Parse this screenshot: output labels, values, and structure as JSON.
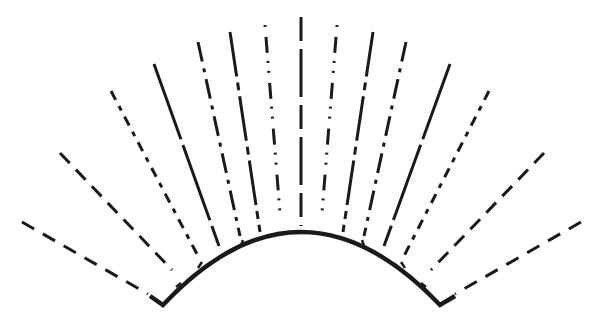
{
  "diagram": {
    "type": "radial-lines-over-arc",
    "stroke_color": "#1a1a1a",
    "background": "#ffffff",
    "arc": {
      "left_end": [
        163,
        305
      ],
      "right_end": [
        440,
        305
      ],
      "apex": [
        301,
        232
      ],
      "left_foot": [
        150,
        296
      ],
      "right_foot": [
        455,
        296
      ]
    },
    "rays": [
      {
        "id": "L1",
        "x1": 22,
        "y1": 222,
        "x2": 148,
        "y2": 294,
        "dash": "14 10"
      },
      {
        "id": "L2",
        "x1": 60,
        "y1": 153,
        "x2": 172,
        "y2": 270,
        "dash": "14 9"
      },
      {
        "id": "L3",
        "x1": 111,
        "y1": 91,
        "x2": 198,
        "y2": 256,
        "dash": "10 7 5 7"
      },
      {
        "id": "L4",
        "x1": 154,
        "y1": 64,
        "x2": 219,
        "y2": 246,
        "dash": "80 6"
      },
      {
        "id": "L5",
        "x1": 198,
        "y1": 42,
        "x2": 240,
        "y2": 236,
        "dash": "20 7 4 7"
      },
      {
        "id": "L6",
        "x1": 230,
        "y1": 32,
        "x2": 260,
        "y2": 232,
        "dash": "45 6 8 6"
      },
      {
        "id": "L7",
        "x1": 265,
        "y1": 25,
        "x2": 280,
        "y2": 213,
        "dash": "2 10 16 8 2 8"
      },
      {
        "id": "C",
        "x1": 301,
        "y1": 17,
        "x2": 301,
        "y2": 226,
        "dash": "24 8 48 8"
      },
      {
        "id": "R7",
        "x1": 337,
        "y1": 25,
        "x2": 322,
        "y2": 213,
        "dash": "2 10 16 8 2 8"
      },
      {
        "id": "R6",
        "x1": 373,
        "y1": 32,
        "x2": 343,
        "y2": 232,
        "dash": "45 6 8 6"
      },
      {
        "id": "R5",
        "x1": 406,
        "y1": 42,
        "x2": 364,
        "y2": 236,
        "dash": "20 7 4 7"
      },
      {
        "id": "R4",
        "x1": 450,
        "y1": 64,
        "x2": 384,
        "y2": 246,
        "dash": "80 6"
      },
      {
        "id": "R3",
        "x1": 489,
        "y1": 91,
        "x2": 404,
        "y2": 256,
        "dash": "10 7 5 7"
      },
      {
        "id": "R2",
        "x1": 544,
        "y1": 153,
        "x2": 431,
        "y2": 270,
        "dash": "14 9"
      },
      {
        "id": "R1",
        "x1": 581,
        "y1": 222,
        "x2": 455,
        "y2": 294,
        "dash": "14 10"
      }
    ],
    "ticks": [
      {
        "x1": 176,
        "y1": 287,
        "x2": 181,
        "y2": 283
      },
      {
        "x1": 198,
        "y1": 268,
        "x2": 202,
        "y2": 262
      },
      {
        "x1": 241,
        "y1": 246,
        "x2": 243,
        "y2": 240
      },
      {
        "x1": 362,
        "y1": 240,
        "x2": 364,
        "y2": 246
      },
      {
        "x1": 401,
        "y1": 262,
        "x2": 405,
        "y2": 268
      },
      {
        "x1": 421,
        "y1": 283,
        "x2": 426,
        "y2": 287
      }
    ]
  }
}
